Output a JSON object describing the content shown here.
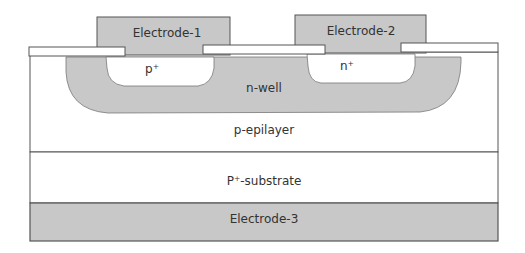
{
  "diagram": {
    "colors": {
      "electrode": "#c8c8c8",
      "nwell": "#c8c8c8",
      "region": "#ffffff",
      "stroke": "#555555",
      "text": "#333333"
    },
    "labels": {
      "electrode1": "Electrode-1",
      "electrode2": "Electrode-2",
      "electrode3": "Electrode-3",
      "p_plus": "p⁺",
      "n_plus": "n⁺",
      "nwell": "n-well",
      "epilayer": "p-epilayer",
      "substrate": "P⁺-substrate"
    }
  }
}
